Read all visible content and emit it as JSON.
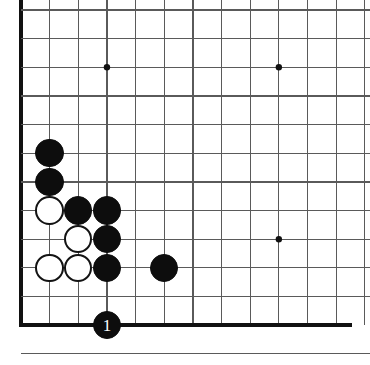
{
  "diagram": {
    "board_size": 19,
    "view": "bottom-left corner, cropped",
    "colors": {
      "background": "#ffffff",
      "grid_line": "#5a5a5a",
      "edge_line": "#111111",
      "black_stone": "#0d0d0d",
      "white_stone": "#ffffff",
      "white_stone_border": "#131313",
      "star_point": "#111111",
      "label_text": "#ffffff"
    },
    "geometry": {
      "origin_x": 21,
      "origin_y": 10,
      "spacing": 28.65,
      "cols": 12,
      "rows": 12,
      "stone_radius": 14.2,
      "edge_line_width": 3.4,
      "grid_line_width": 1.2,
      "star_radius": 3.2
    },
    "edges": {
      "left_edge_col": 0,
      "bottom_edge_row": 11,
      "top_cropped": true,
      "right_cropped": true
    },
    "star_points": [
      {
        "col": 3,
        "row": 2,
        "name": "star-point-upper-left"
      },
      {
        "col": 9,
        "row": 2,
        "name": "star-point-upper-right"
      },
      {
        "col": 9,
        "row": 8,
        "name": "star-point-lower-right"
      }
    ],
    "stones": [
      {
        "col": 1,
        "row": 5,
        "color": "black",
        "label": "",
        "name": "black-stone-b1-r5"
      },
      {
        "col": 1,
        "row": 6,
        "color": "black",
        "label": "",
        "name": "black-stone-b1-r6"
      },
      {
        "col": 1,
        "row": 7,
        "color": "white",
        "label": "",
        "name": "white-stone-c1-r7"
      },
      {
        "col": 2,
        "row": 7,
        "color": "black",
        "label": "",
        "name": "black-stone-b2-r7"
      },
      {
        "col": 3,
        "row": 7,
        "color": "black",
        "label": "",
        "name": "black-stone-b3-r7"
      },
      {
        "col": 2,
        "row": 8,
        "color": "white",
        "label": "",
        "name": "white-stone-c2-r8"
      },
      {
        "col": 3,
        "row": 8,
        "color": "black",
        "label": "",
        "name": "black-stone-b3-r8"
      },
      {
        "col": 1,
        "row": 9,
        "color": "white",
        "label": "",
        "name": "white-stone-c1-r9"
      },
      {
        "col": 2,
        "row": 9,
        "color": "white",
        "label": "",
        "name": "white-stone-c2-r9"
      },
      {
        "col": 3,
        "row": 9,
        "color": "black",
        "label": "",
        "name": "black-stone-b3-r9"
      },
      {
        "col": 5,
        "row": 9,
        "color": "black",
        "label": "",
        "name": "black-stone-b5-r9"
      },
      {
        "col": 3,
        "row": 11,
        "color": "black",
        "label": "1",
        "name": "move-stone-1"
      }
    ],
    "move_labels": [
      {
        "number": "1",
        "col": 3,
        "row": 11,
        "color": "black"
      }
    ]
  }
}
